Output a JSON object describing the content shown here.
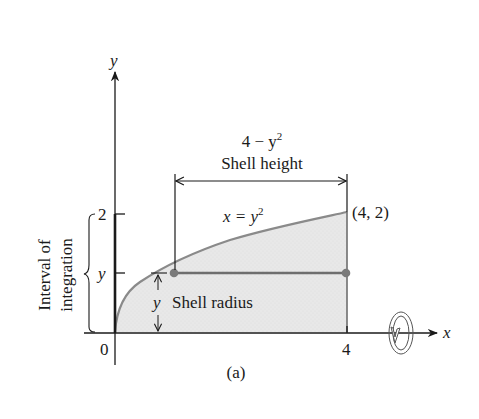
{
  "figure": {
    "caption": "(a)",
    "axes": {
      "x_label": "x",
      "y_label": "y",
      "origin_label": "0",
      "x_tick_label": "4",
      "y_tick_top_label": "2",
      "y_tick_mid_label": "y"
    },
    "curve": {
      "equation_lhs": "x = y",
      "equation_exp": "2"
    },
    "point_label": "(4, 2)",
    "shell_height": {
      "formula_main": "4 − y",
      "formula_exp": "2",
      "label": "Shell height"
    },
    "shell_radius": {
      "symbol": "y",
      "label": "Shell radius"
    },
    "interval": {
      "line1": "Interval of",
      "line2": "integration"
    },
    "rotation_icon": "rotation-about-x-axis",
    "colors": {
      "fill": "#e6e6e6",
      "curve": "#8a8a8a",
      "axis": "#1a1a1a",
      "shell_line": "#6e6e6e",
      "dot": "#7a7a7a"
    }
  }
}
